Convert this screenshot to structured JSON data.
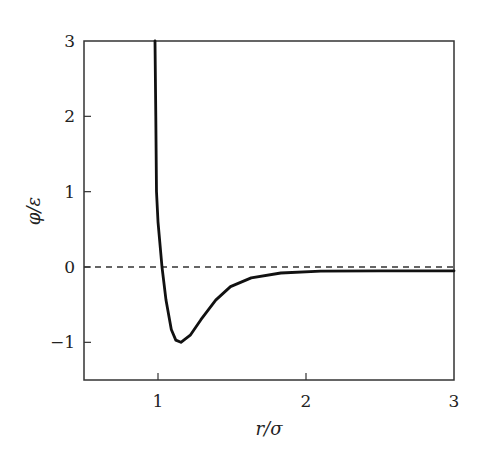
{
  "chart_data": {
    "type": "line",
    "title": "",
    "xlabel": "r/σ",
    "ylabel": "φ/ε",
    "xlim": [
      0.5,
      3
    ],
    "ylim": [
      -1.5,
      3
    ],
    "grid": false,
    "legend": null,
    "x_ticks": [
      1,
      2,
      3
    ],
    "x_tick_labels": [
      "1",
      "2",
      "3"
    ],
    "y_ticks": [
      -1,
      0,
      1,
      2,
      3
    ],
    "y_tick_labels": [
      "−1",
      "0",
      "1",
      "2",
      "3"
    ],
    "reference_line": {
      "y": 0,
      "style": "dashed",
      "color": "#333333"
    },
    "series": [
      {
        "name": "potential",
        "color": "#111111",
        "x": [
          0.98,
          0.985,
          0.99,
          1.0,
          1.027,
          1.054,
          1.09,
          1.12,
          1.155,
          1.22,
          1.29,
          1.39,
          1.49,
          1.63,
          1.83,
          2.1,
          2.5,
          3.0
        ],
        "y": [
          3.0,
          2.0,
          1.0,
          0.6,
          0.0,
          -0.44,
          -0.83,
          -0.97,
          -1.0,
          -0.9,
          -0.7,
          -0.44,
          -0.26,
          -0.145,
          -0.08,
          -0.055,
          -0.05,
          -0.05
        ]
      }
    ]
  },
  "labels": {
    "xlabel": "r/σ",
    "ylabel": "φ/ε",
    "x_ticks": [
      "1",
      "2",
      "3"
    ],
    "y_ticks": [
      "−1",
      "0",
      "1",
      "2",
      "3"
    ]
  }
}
